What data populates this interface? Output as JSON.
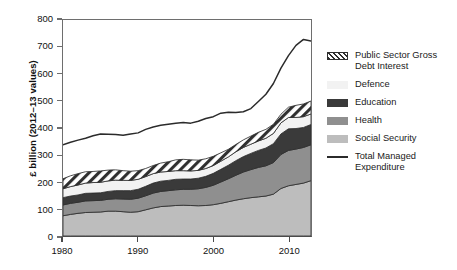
{
  "chart_data": {
    "type": "area",
    "stacked": true,
    "title": "",
    "xlabel": "",
    "ylabel": "£ billion (2012–13 values)",
    "xlim": [
      1980,
      2013
    ],
    "ylim": [
      0,
      800
    ],
    "ytick_labels": [
      "0",
      "100",
      "200",
      "300",
      "400",
      "500",
      "600",
      "700",
      "800"
    ],
    "ytick_values": [
      0,
      100,
      200,
      300,
      400,
      500,
      600,
      700,
      800
    ],
    "xtick_labels": [
      "1980",
      "1990",
      "2000",
      "2010"
    ],
    "xtick_values": [
      1980,
      1990,
      2000,
      2010
    ],
    "grid": false,
    "legend_position": "right",
    "x": [
      1980,
      1981,
      1982,
      1983,
      1984,
      1985,
      1986,
      1987,
      1988,
      1989,
      1990,
      1991,
      1992,
      1993,
      1994,
      1995,
      1996,
      1997,
      1998,
      1999,
      2000,
      2001,
      2002,
      2003,
      2004,
      2005,
      2006,
      2007,
      2008,
      2009,
      2010,
      2011,
      2012,
      2013
    ],
    "series": [
      {
        "name": "Social Security",
        "color": "#bdbdbd",
        "fill": "solid",
        "values": [
          75,
          80,
          84,
          87,
          88,
          89,
          92,
          92,
          90,
          88,
          90,
          97,
          104,
          109,
          111,
          113,
          114,
          113,
          112,
          113,
          116,
          121,
          127,
          133,
          138,
          142,
          145,
          148,
          155,
          176,
          186,
          191,
          196,
          205
        ]
      },
      {
        "name": "Health",
        "color": "#8f8f8f",
        "fill": "solid",
        "values": [
          40,
          41,
          41,
          43,
          43,
          43,
          44,
          46,
          47,
          48,
          50,
          52,
          55,
          56,
          57,
          58,
          59,
          60,
          63,
          67,
          72,
          79,
          85,
          92,
          99,
          104,
          109,
          112,
          117,
          126,
          131,
          131,
          132,
          133
        ]
      },
      {
        "name": "Education",
        "color": "#3a3a3a",
        "fill": "solid",
        "values": [
          27,
          27,
          27,
          28,
          28,
          28,
          29,
          30,
          31,
          32,
          33,
          35,
          37,
          38,
          38,
          39,
          38,
          38,
          39,
          41,
          44,
          47,
          50,
          54,
          57,
          60,
          63,
          66,
          70,
          76,
          80,
          76,
          74,
          75
        ]
      },
      {
        "name": "Defence",
        "color": "#f2f2f2",
        "fill": "solid",
        "values": [
          33,
          35,
          37,
          38,
          39,
          39,
          39,
          39,
          38,
          38,
          37,
          36,
          35,
          34,
          33,
          32,
          31,
          30,
          29,
          29,
          29,
          30,
          31,
          33,
          34,
          34,
          35,
          36,
          38,
          41,
          42,
          41,
          40,
          39
        ]
      },
      {
        "name": "Public Sector Gross Debt Interest",
        "color": "#ffffff",
        "fill": "hatch",
        "values": [
          37,
          40,
          42,
          42,
          41,
          42,
          40,
          38,
          36,
          34,
          32,
          30,
          30,
          33,
          36,
          40,
          42,
          41,
          38,
          36,
          34,
          31,
          28,
          27,
          28,
          30,
          32,
          33,
          34,
          32,
          38,
          45,
          47,
          48
        ]
      }
    ],
    "line_series": {
      "name": "Total Managed Expenditure",
      "color": "#2b2b2b",
      "values": [
        338,
        347,
        355,
        362,
        371,
        378,
        377,
        376,
        373,
        378,
        382,
        395,
        404,
        410,
        414,
        418,
        420,
        418,
        425,
        435,
        442,
        455,
        458,
        457,
        460,
        472,
        498,
        525,
        565,
        622,
        668,
        706,
        728,
        722,
        712
      ]
    }
  },
  "legend": {
    "items": [
      {
        "label": "Public Sector Gross Debt Interest",
        "swatch": "hatched-diagonal"
      },
      {
        "label": "Defence",
        "swatch": "solid-very-light-gray"
      },
      {
        "label": "Education",
        "swatch": "solid-dark-gray"
      },
      {
        "label": "Health",
        "swatch": "solid-medium-gray"
      },
      {
        "label": "Social Security",
        "swatch": "solid-light-gray"
      },
      {
        "label": "Total Managed Expenditure",
        "swatch": "line-dark"
      }
    ]
  }
}
